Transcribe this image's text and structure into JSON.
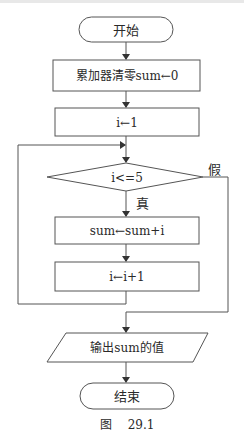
{
  "diagram": {
    "type": "flowchart",
    "stroke_color": "#555555",
    "nodes": {
      "start": {
        "shape": "terminator",
        "label": "开始"
      },
      "init_sum": {
        "shape": "process",
        "label": "累加器清零sum←0"
      },
      "init_i": {
        "shape": "process",
        "label": "i←1"
      },
      "condition": {
        "shape": "decision",
        "label": "i<=5"
      },
      "accumulate": {
        "shape": "process",
        "label": "sum←sum+i"
      },
      "increment": {
        "shape": "process",
        "label": "i←i+1"
      },
      "output": {
        "shape": "io",
        "label": "输出sum的值"
      },
      "end": {
        "shape": "terminator",
        "label": "结束"
      }
    },
    "edges": {
      "true_label": "真",
      "false_label": "假"
    },
    "caption": {
      "prefix": "图",
      "number": "29.1"
    }
  }
}
